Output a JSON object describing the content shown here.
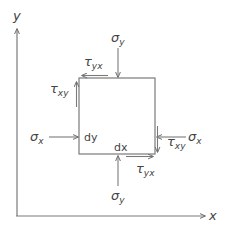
{
  "diagram": {
    "type": "2D stress element",
    "colors": {
      "line": "#7a7a7a",
      "text": "#444444",
      "background": "#ffffff"
    },
    "axes": {
      "x_label": "x",
      "y_label": "y"
    },
    "element": {
      "width_label": "dx",
      "height_label": "dy"
    },
    "normal_stresses": {
      "top": {
        "symbol": "σ",
        "sub": "y"
      },
      "bottom": {
        "symbol": "σ",
        "sub": "y"
      },
      "left": {
        "symbol": "σ",
        "sub": "x"
      },
      "right": {
        "symbol": "σ",
        "sub": "x"
      }
    },
    "shear_stresses": {
      "top": {
        "symbol": "τ",
        "sub": "yx"
      },
      "bottom": {
        "symbol": "τ",
        "sub": "yx"
      },
      "left": {
        "symbol": "τ",
        "sub": "xy"
      },
      "right": {
        "symbol": "τ",
        "sub": "xy"
      }
    }
  }
}
